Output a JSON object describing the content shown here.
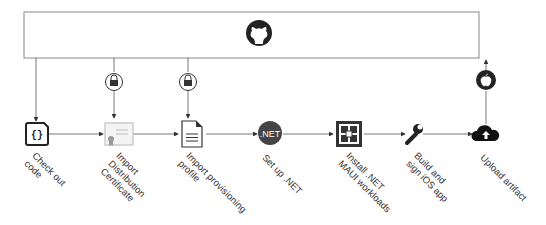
{
  "diagram": {
    "title_icon": "github-icon",
    "steps": [
      {
        "label": "Check out\ncode",
        "icon": "code-file-icon"
      },
      {
        "label": "Import\nDistribution\nCertificate",
        "icon": "certificate-icon",
        "secret": "lock-icon"
      },
      {
        "label": "Import provisioning\nprofile",
        "icon": "document-icon",
        "secret": "lock-icon"
      },
      {
        "label": "Set up .NET",
        "icon": "dotnet-icon",
        "icon_text": ".NET"
      },
      {
        "label": "Install .NET\nMAUI workloads",
        "icon": "workloads-icon"
      },
      {
        "label": "Build and\nsign iOS app",
        "icon": "wrench-icon"
      },
      {
        "label": "Upload artifact",
        "icon": "cloud-upload-icon",
        "target": "apple-icon"
      }
    ]
  }
}
